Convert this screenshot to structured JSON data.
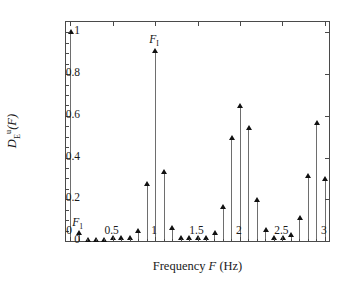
{
  "chart_data": {
    "type": "bar",
    "title": "",
    "subtitle": "",
    "xlabel": "Frequency F (Hz)",
    "ylabel": "D_E^u(F)",
    "ylabel_parts": {
      "base": "D",
      "sub": "E",
      "sup": "u",
      "arg": "(F)"
    },
    "xlim": [
      -0.05,
      3.05
    ],
    "ylim": [
      0,
      1.05
    ],
    "grid": false,
    "legend": null,
    "marker": "triangle-up",
    "stem_plot": true,
    "xticks": [
      0,
      0.5,
      1,
      1.5,
      2,
      2.5,
      3
    ],
    "xticklabels": [
      "0",
      "0.5",
      "1",
      "1.5",
      "2",
      "2.5",
      "3"
    ],
    "yticks": [
      0,
      0.2,
      0.4,
      0.6,
      0.8,
      1
    ],
    "yticklabels": [
      "0",
      "0.2",
      "0.4",
      "0.6",
      "0.8",
      "1"
    ],
    "x": [
      0,
      0.1,
      0.2,
      0.3,
      0.4,
      0.5,
      0.6,
      0.7,
      0.8,
      0.9,
      1.0,
      1.1,
      1.2,
      1.3,
      1.4,
      1.5,
      1.6,
      1.7,
      1.8,
      1.9,
      2.0,
      2.1,
      2.2,
      2.3,
      2.4,
      2.5,
      2.6,
      2.7,
      2.8,
      2.9,
      3.0
    ],
    "values": [
      1.0,
      0.035,
      0.004,
      0.004,
      0.004,
      0.012,
      0.012,
      0.012,
      0.045,
      0.27,
      0.91,
      0.33,
      0.06,
      0.012,
      0.01,
      0.01,
      0.012,
      0.035,
      0.16,
      0.49,
      0.645,
      0.54,
      0.195,
      0.05,
      0.012,
      0.012,
      0.025,
      0.11,
      0.31,
      0.565,
      0.295
    ],
    "annotations": [
      {
        "label": "F_1",
        "base": "F",
        "sub": "1",
        "x": 0.1,
        "y": 0.035
      },
      {
        "label": "F_I",
        "base": "F",
        "sub": "I",
        "x": 1.0,
        "y": 0.91
      }
    ],
    "colors": {
      "stem": "#6e6e6e",
      "marker": "#111111",
      "axis": "#4a4a4a",
      "background": "#ffffff"
    }
  }
}
